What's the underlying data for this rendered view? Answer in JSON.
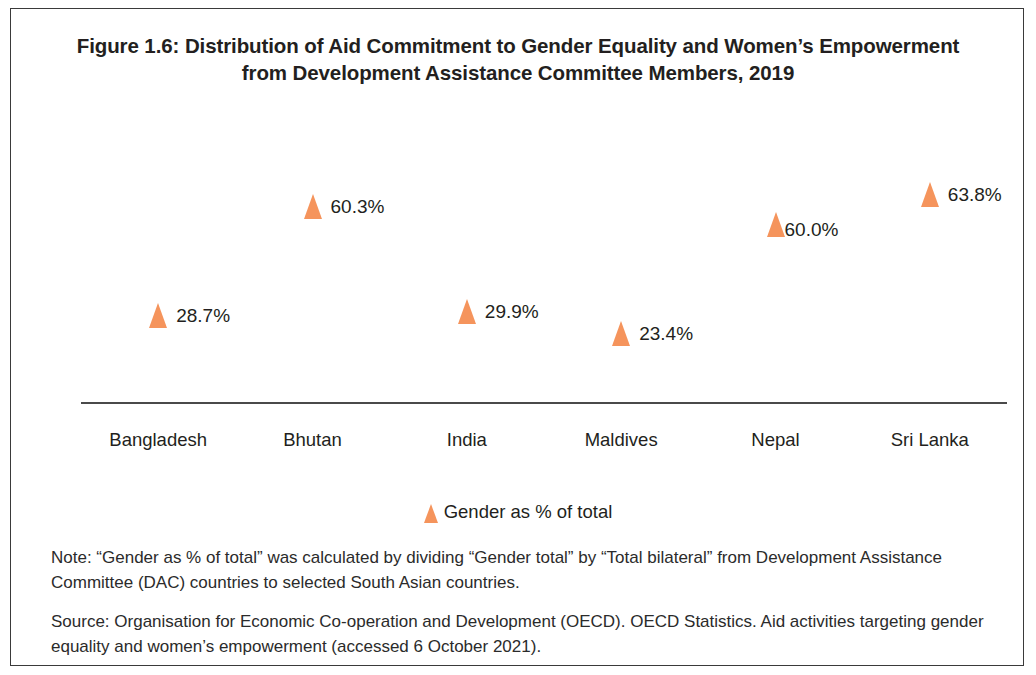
{
  "figure": {
    "title_line1": "Figure 1.6: Distribution of Aid Commitment to Gender Equality and Women’s Empowerment",
    "title_line2": "from Development Assistance Committee Members, 2019"
  },
  "legend": {
    "marker_name": "triangle-marker-icon",
    "label": "Gender as % of total"
  },
  "footer": {
    "note": "Note: “Gender as % of total” was calculated by dividing “Gender total” by “Total bilateral” from Development Assistance Committee (DAC) countries to selected South Asian countries.",
    "source": "Source: Organisation for Economic Co-operation and Development (OECD). OECD Statistics. Aid activities targeting gender equality and women’s empowerment (accessed 6 October 2021)."
  },
  "chart_data": {
    "type": "scatter",
    "title": "Figure 1.6: Distribution of Aid Commitment to Gender Equality and Women’s Empowerment from Development Assistance Committee Members, 2019",
    "xlabel": "",
    "ylabel": "",
    "ylim": [
      0,
      70
    ],
    "grid": false,
    "legend_position": "bottom-center",
    "marker_color": "#f5945c",
    "axis_color": "#4a4a4a",
    "categories": [
      "Bangladesh",
      "Bhutan",
      "India",
      "Maldives",
      "Nepal",
      "Sri Lanka"
    ],
    "series": [
      {
        "name": "Gender as % of total",
        "values": [
          28.7,
          60.3,
          29.9,
          23.4,
          60.0,
          63.8
        ],
        "data_labels": [
          "28.7%",
          "60.3%",
          "29.9%",
          "23.4%",
          "60.0%",
          "63.8%"
        ],
        "label_positions": [
          "right",
          "right",
          "right",
          "right",
          "below-right",
          "right"
        ]
      }
    ]
  }
}
